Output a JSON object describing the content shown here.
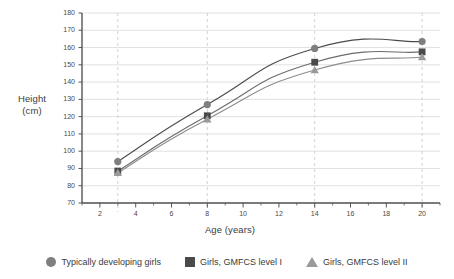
{
  "chart_data": {
    "type": "line",
    "title": "",
    "xlabel": "Age (years)",
    "ylabel": "Height (cm)",
    "ylabel_line1": "Height",
    "ylabel_line2": "(cm)",
    "x": [
      3,
      8,
      14,
      20
    ],
    "xlim": [
      1,
      21
    ],
    "ylim": [
      70,
      180
    ],
    "xticks": [
      2,
      4,
      6,
      8,
      10,
      12,
      14,
      16,
      18,
      20
    ],
    "xtick_labels": [
      "2",
      "4",
      "6",
      "8",
      "10",
      "12",
      "14",
      "16",
      "18",
      "20"
    ],
    "xminor_ticks": [
      1,
      3,
      5,
      7,
      9,
      11,
      13,
      15,
      17,
      19,
      21
    ],
    "yticks": [
      70,
      80,
      90,
      100,
      110,
      120,
      130,
      140,
      150,
      160,
      170,
      180
    ],
    "ytick_labels": [
      "70",
      "80",
      "90",
      "100",
      "110",
      "120",
      "130",
      "140",
      "150",
      "160",
      "170",
      "180"
    ],
    "grid": "horizontal-solid-and-vertical-dashed-at-data-ages",
    "vertical_gridlines_at": [
      3,
      8,
      14,
      20
    ],
    "legend_position": "below",
    "series": [
      {
        "name": "Typically developing girls",
        "marker": "circle",
        "color": "#7f7f7f",
        "line_color": "#4a4a4a",
        "values": [
          94,
          127,
          159.5,
          163.5
        ]
      },
      {
        "name": "Girls, GMFCS level I",
        "marker": "square",
        "color": "#4a4a4a",
        "line_color": "#6b6b6b",
        "values": [
          88.5,
          120.5,
          151.5,
          157.5
        ]
      },
      {
        "name": "Girls, GMFCS level II",
        "marker": "triangle",
        "color": "#9a9a9a",
        "line_color": "#8c8c8c",
        "values": [
          87.5,
          118.5,
          147,
          154.5
        ]
      }
    ]
  },
  "legend": {
    "items": [
      {
        "label": "Typically developing girls",
        "marker": "circle-marker-icon",
        "color": "#7f7f7f"
      },
      {
        "label": "Girls, GMFCS level I",
        "marker": "square-marker-icon",
        "color": "#4a4a4a"
      },
      {
        "label": "Girls, GMFCS level II",
        "marker": "triangle-marker-icon",
        "color": "#9a9a9a"
      }
    ]
  },
  "colors": {
    "background": "#ffffff",
    "axis": "#555555",
    "gridline": "#d9d9d9",
    "dashed_gridline": "#c6c6c6",
    "text": "#3b3b3b"
  }
}
